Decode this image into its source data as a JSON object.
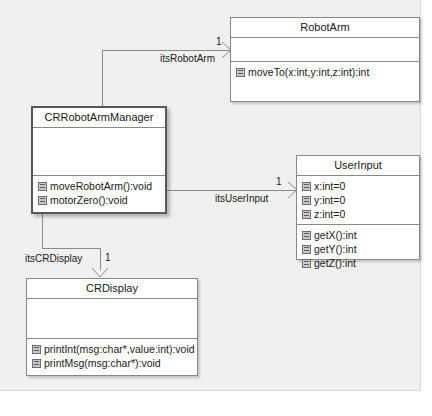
{
  "diagram": {
    "type": "uml-class-diagram",
    "background_color": "#f0f0f0",
    "line_color": "#8a8a8a",
    "classes": [
      {
        "id": "robotarm",
        "name": "RobotArm",
        "attributes": [],
        "operations": [
          "moveTo(x:int,y:int,z:int):int"
        ]
      },
      {
        "id": "crrobotarmmanager",
        "name": "CRRobotArmManager",
        "emphasis": true,
        "attributes": [],
        "operations": [
          "moveRobotArm():void",
          "motorZero():void"
        ]
      },
      {
        "id": "userinput",
        "name": "UserInput",
        "attributes": [
          "x:int=0",
          "y:int=0",
          "z:int=0"
        ],
        "operations": [
          "getX():int",
          "getY():int",
          "getZ():int"
        ]
      },
      {
        "id": "crdisplay",
        "name": "CRDisplay",
        "attributes": [],
        "operations": [
          "printInt(msg:char*,value:int):void",
          "printMsg(msg:char*):void"
        ]
      }
    ],
    "associations": [
      {
        "id": "its-robot-arm",
        "source": "crrobotarmmanager",
        "target": "robotarm",
        "role_label": "itsRobotArm",
        "multiplicity": "1"
      },
      {
        "id": "its-user-input",
        "source": "crrobotarmmanager",
        "target": "userinput",
        "role_label": "itsUserInput",
        "multiplicity": "1"
      },
      {
        "id": "its-cr-display",
        "source": "crrobotarmmanager",
        "target": "crdisplay",
        "role_label": "itsCRDisplay",
        "multiplicity": "1"
      }
    ]
  }
}
